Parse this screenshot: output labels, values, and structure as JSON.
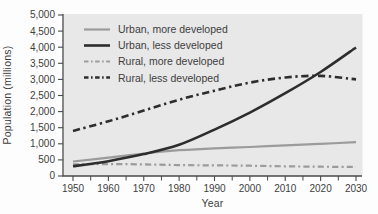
{
  "chart_data": {
    "type": "line",
    "title": "",
    "xlabel": "Year",
    "ylabel": "Population (millions)",
    "x": [
      1950,
      1960,
      1970,
      1980,
      1990,
      2000,
      2010,
      2020,
      2030
    ],
    "x_tick_labels": [
      "1950",
      "1960",
      "1970",
      "1980",
      "1990",
      "2000",
      "2010",
      "2020",
      "2030"
    ],
    "x_minor_tick_step": 5,
    "xlim": [
      1950,
      2030
    ],
    "ylim": [
      0,
      5000
    ],
    "y_ticks": [
      0,
      500,
      1000,
      1500,
      2000,
      2500,
      3000,
      3500,
      4000,
      4500,
      5000
    ],
    "y_tick_labels": [
      "0",
      "500",
      "1,000",
      "1,500",
      "2,000",
      "2,500",
      "3,000",
      "3,500",
      "4,000",
      "4,500",
      "5,000"
    ],
    "grid": false,
    "legend_position": "top-left-inside",
    "series": [
      {
        "name": "Urban, more developed",
        "color": "#9b9b9b",
        "line_style": "solid",
        "line_width": 2.2,
        "values": [
          450,
          570,
          700,
          800,
          860,
          900,
          950,
          1000,
          1050
        ]
      },
      {
        "name": "Urban, less developed",
        "color": "#2d2d2d",
        "line_style": "solid",
        "line_width": 2.6,
        "values": [
          300,
          460,
          680,
          970,
          1440,
          1970,
          2570,
          3230,
          3990
        ]
      },
      {
        "name": "Rural, more developed",
        "color": "#9b9b9b",
        "line_style": "dash-dot",
        "line_width": 2.2,
        "values": [
          360,
          370,
          360,
          340,
          330,
          320,
          300,
          290,
          280
        ]
      },
      {
        "name": "Rural, less developed",
        "color": "#2d2d2d",
        "line_style": "dash-dot",
        "line_width": 2.6,
        "values": [
          1400,
          1700,
          2030,
          2370,
          2650,
          2900,
          3060,
          3110,
          3000
        ]
      }
    ],
    "colors": {
      "plot_background": "#e8e8e8",
      "axis": "#4a4a4a",
      "text": "#3d3d3d"
    }
  }
}
